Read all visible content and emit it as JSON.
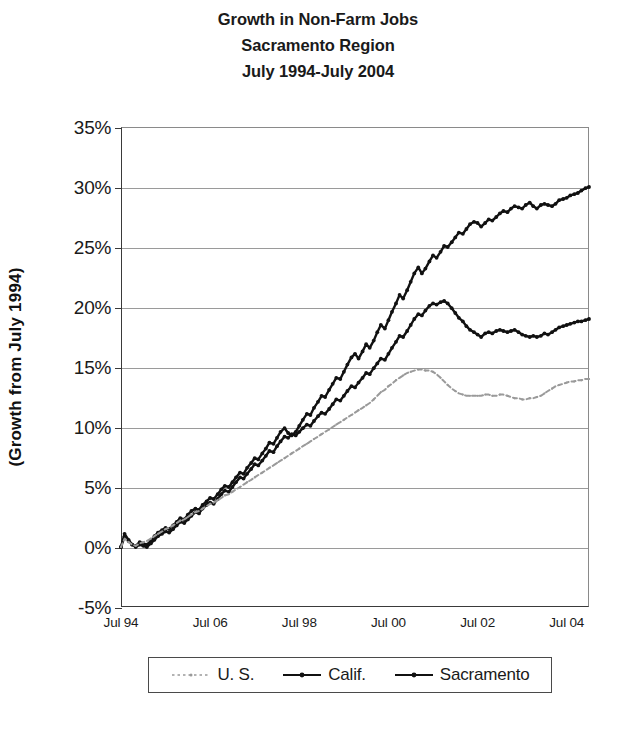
{
  "title": {
    "line1": "Growth in Non-Farm Jobs",
    "line2": "Sacramento Region",
    "line3": "July 1994-July 2004"
  },
  "axes": {
    "y_title": "(Growth from July 1994)",
    "y_ticks": [
      "35%",
      "30%",
      "25%",
      "20%",
      "15%",
      "10%",
      "5%",
      "0%",
      "-5%"
    ],
    "x_ticks": [
      "Jul 94",
      "Jul 06",
      "Jul 98",
      "Jul 00",
      "Jul 02",
      "Jul 04"
    ]
  },
  "legend": {
    "items": [
      {
        "label": "U. S.",
        "color": "#9a9a9a",
        "style": "dotted"
      },
      {
        "label": "Calif.",
        "color": "#111111",
        "style": "solid"
      },
      {
        "label": "Sacramento",
        "color": "#111111",
        "style": "solid"
      }
    ]
  },
  "chart_data": {
    "type": "line",
    "title": "Growth in Non-Farm Jobs Sacramento Region July 1994-July 2004",
    "xlabel": "",
    "ylabel": "(Growth from July 1994)",
    "ylim": [
      -5,
      35
    ],
    "ytick_values": [
      35,
      30,
      25,
      20,
      15,
      10,
      5,
      0,
      -5
    ],
    "grid": "horizontal",
    "legend_position": "bottom",
    "x_tick_labels": [
      "Jul 94",
      "Jul 06",
      "Jul 98",
      "Jul 00",
      "Jul 02",
      "Jul 04"
    ],
    "x_tick_years": [
      1994,
      1996,
      1998,
      2000,
      2002,
      2004
    ],
    "x": [
      1994.0,
      1994.08,
      1994.17,
      1994.25,
      1994.33,
      1994.42,
      1994.5,
      1994.58,
      1994.67,
      1994.75,
      1994.83,
      1994.92,
      1995.0,
      1995.08,
      1995.17,
      1995.25,
      1995.33,
      1995.42,
      1995.5,
      1995.58,
      1995.67,
      1995.75,
      1995.83,
      1995.92,
      1996.0,
      1996.08,
      1996.17,
      1996.25,
      1996.33,
      1996.42,
      1996.5,
      1996.58,
      1996.67,
      1996.75,
      1996.83,
      1996.92,
      1997.0,
      1997.08,
      1997.17,
      1997.25,
      1997.33,
      1997.42,
      1997.5,
      1997.58,
      1997.67,
      1997.75,
      1997.83,
      1997.92,
      1998.0,
      1998.08,
      1998.17,
      1998.25,
      1998.33,
      1998.42,
      1998.5,
      1998.58,
      1998.67,
      1998.75,
      1998.83,
      1998.92,
      1999.0,
      1999.08,
      1999.17,
      1999.25,
      1999.33,
      1999.42,
      1999.5,
      1999.58,
      1999.67,
      1999.75,
      1999.83,
      1999.92,
      2000.0,
      2000.08,
      2000.17,
      2000.25,
      2000.33,
      2000.42,
      2000.5,
      2000.58,
      2000.67,
      2000.75,
      2000.83,
      2000.92,
      2001.0,
      2001.08,
      2001.17,
      2001.25,
      2001.33,
      2001.42,
      2001.5,
      2001.58,
      2001.67,
      2001.75,
      2001.83,
      2001.92,
      2002.0,
      2002.08,
      2002.17,
      2002.25,
      2002.33,
      2002.42,
      2002.5,
      2002.58,
      2002.67,
      2002.75,
      2002.83,
      2002.92,
      2003.0,
      2003.08,
      2003.17,
      2003.25,
      2003.33,
      2003.42,
      2003.5,
      2003.58,
      2003.67,
      2003.75,
      2003.83,
      2003.92,
      2004.0,
      2004.08,
      2004.17,
      2004.25,
      2004.33,
      2004.42,
      2004.5
    ],
    "series": [
      {
        "name": "Sacramento",
        "color": "#111111",
        "style": "solid",
        "values": [
          0.0,
          1.1,
          0.6,
          0.2,
          0.1,
          0.4,
          0.3,
          0.2,
          0.5,
          0.9,
          1.2,
          1.4,
          1.6,
          1.5,
          1.8,
          2.1,
          2.4,
          2.3,
          2.7,
          3.0,
          3.2,
          3.1,
          3.5,
          3.8,
          4.1,
          4.0,
          4.4,
          4.8,
          5.1,
          5.0,
          5.4,
          5.8,
          6.2,
          6.1,
          6.6,
          7.0,
          7.4,
          7.3,
          7.8,
          8.2,
          8.7,
          8.6,
          9.1,
          9.6,
          9.9,
          9.5,
          9.3,
          9.6,
          10.1,
          10.6,
          11.1,
          11.0,
          11.6,
          12.1,
          12.6,
          12.5,
          13.1,
          13.6,
          14.1,
          14.0,
          14.6,
          15.2,
          15.8,
          16.1,
          15.7,
          16.3,
          16.9,
          16.6,
          17.2,
          17.9,
          18.5,
          18.2,
          18.9,
          19.6,
          20.3,
          21.0,
          20.7,
          21.4,
          22.1,
          22.8,
          23.3,
          22.8,
          23.2,
          23.8,
          24.3,
          24.1,
          24.6,
          25.1,
          25.0,
          25.4,
          25.8,
          26.2,
          26.1,
          26.5,
          26.9,
          27.1,
          27.0,
          26.7,
          27.0,
          27.3,
          27.2,
          27.5,
          27.8,
          28.0,
          27.9,
          28.2,
          28.4,
          28.3,
          28.2,
          28.5,
          28.7,
          28.4,
          28.2,
          28.5,
          28.6,
          28.5,
          28.4,
          28.6,
          28.9,
          29.0,
          29.1,
          29.3,
          29.4,
          29.5,
          29.7,
          29.9,
          30.0
        ]
      },
      {
        "name": "Calif.",
        "color": "#111111",
        "style": "solid",
        "values": [
          0.0,
          0.9,
          0.5,
          0.2,
          0.0,
          0.2,
          0.1,
          0.0,
          0.3,
          0.6,
          0.9,
          1.1,
          1.3,
          1.2,
          1.5,
          1.8,
          2.1,
          2.0,
          2.3,
          2.6,
          2.9,
          2.8,
          3.2,
          3.5,
          3.7,
          3.6,
          4.0,
          4.4,
          4.7,
          4.6,
          5.0,
          5.4,
          5.8,
          5.7,
          6.1,
          6.5,
          6.9,
          6.8,
          7.2,
          7.6,
          8.0,
          7.9,
          8.4,
          8.8,
          9.2,
          9.1,
          9.4,
          9.3,
          9.6,
          9.9,
          10.2,
          10.1,
          10.5,
          10.9,
          11.2,
          11.1,
          11.5,
          11.9,
          12.3,
          12.2,
          12.6,
          13.0,
          13.4,
          13.3,
          13.7,
          14.1,
          14.5,
          14.4,
          14.9,
          15.3,
          15.7,
          15.6,
          16.1,
          16.6,
          17.1,
          17.6,
          17.5,
          18.0,
          18.5,
          19.0,
          19.4,
          19.3,
          19.7,
          20.1,
          20.3,
          20.2,
          20.4,
          20.5,
          20.3,
          19.9,
          19.5,
          19.1,
          18.8,
          18.4,
          18.1,
          17.9,
          17.7,
          17.5,
          17.8,
          17.9,
          17.8,
          18.0,
          18.1,
          18.0,
          17.9,
          18.0,
          18.1,
          17.9,
          17.7,
          17.6,
          17.5,
          17.6,
          17.5,
          17.6,
          17.8,
          17.7,
          17.9,
          18.1,
          18.3,
          18.4,
          18.5,
          18.6,
          18.7,
          18.8,
          18.8,
          18.9,
          19.0
        ]
      },
      {
        "name": "U. S.",
        "color": "#9a9a9a",
        "style": "dotted",
        "values": [
          0.0,
          0.7,
          0.4,
          0.2,
          0.1,
          0.3,
          0.4,
          0.5,
          0.7,
          0.9,
          1.1,
          1.3,
          1.5,
          1.6,
          1.8,
          2.0,
          2.2,
          2.3,
          2.5,
          2.7,
          2.9,
          3.0,
          3.2,
          3.4,
          3.6,
          3.7,
          3.9,
          4.1,
          4.3,
          4.4,
          4.6,
          4.8,
          5.0,
          5.2,
          5.4,
          5.6,
          5.8,
          6.0,
          6.2,
          6.4,
          6.6,
          6.8,
          7.0,
          7.2,
          7.4,
          7.6,
          7.8,
          8.0,
          8.2,
          8.4,
          8.6,
          8.8,
          9.0,
          9.2,
          9.4,
          9.6,
          9.8,
          10.0,
          10.2,
          10.4,
          10.6,
          10.8,
          11.0,
          11.2,
          11.4,
          11.6,
          11.8,
          12.0,
          12.3,
          12.6,
          12.9,
          13.1,
          13.4,
          13.6,
          13.9,
          14.1,
          14.3,
          14.5,
          14.6,
          14.7,
          14.8,
          14.8,
          14.7,
          14.7,
          14.6,
          14.4,
          14.1,
          13.8,
          13.5,
          13.2,
          13.0,
          12.8,
          12.7,
          12.6,
          12.6,
          12.6,
          12.6,
          12.6,
          12.7,
          12.7,
          12.6,
          12.6,
          12.7,
          12.7,
          12.6,
          12.5,
          12.4,
          12.4,
          12.3,
          12.3,
          12.4,
          12.4,
          12.5,
          12.6,
          12.8,
          13.0,
          13.2,
          13.4,
          13.5,
          13.6,
          13.7,
          13.8,
          13.8,
          13.9,
          13.9,
          14.0,
          14.0
        ]
      }
    ]
  }
}
